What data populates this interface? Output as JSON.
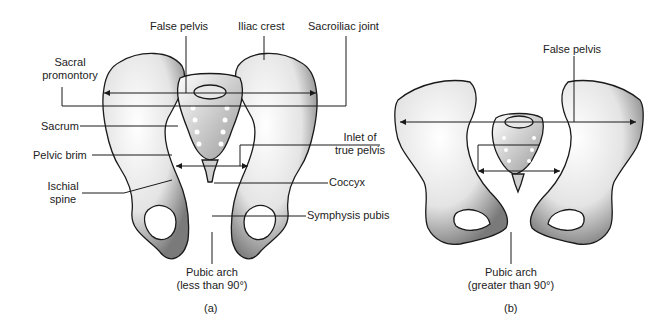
{
  "figure": {
    "panels": [
      {
        "id": "a",
        "caption": "(a)",
        "labels": {
          "false_pelvis": "False pelvis",
          "iliac_crest": "Iliac crest",
          "sacroiliac_joint": "Sacroiliac joint",
          "sacral_promontory_1": "Sacral",
          "sacral_promontory_2": "promontory",
          "sacrum": "Sacrum",
          "pelvic_brim": "Pelvic brim",
          "ischial_spine_1": "Ischial",
          "ischial_spine_2": "spine",
          "inlet_1": "Inlet of",
          "inlet_2": "true pelvis",
          "coccyx": "Coccyx",
          "symphysis_pubis": "Symphysis pubis",
          "pubic_arch_1": "Pubic arch",
          "pubic_arch_2": "(less than 90°)"
        }
      },
      {
        "id": "b",
        "caption": "(b)",
        "labels": {
          "false_pelvis": "False pelvis",
          "pubic_arch_1": "Pubic arch",
          "pubic_arch_2": "(greater than 90°)"
        }
      }
    ],
    "colors": {
      "ink": "#1a1a1a",
      "bone_light": "#f2f2f2",
      "bone_shade": "#8a8a8a",
      "background": "#ffffff"
    }
  }
}
